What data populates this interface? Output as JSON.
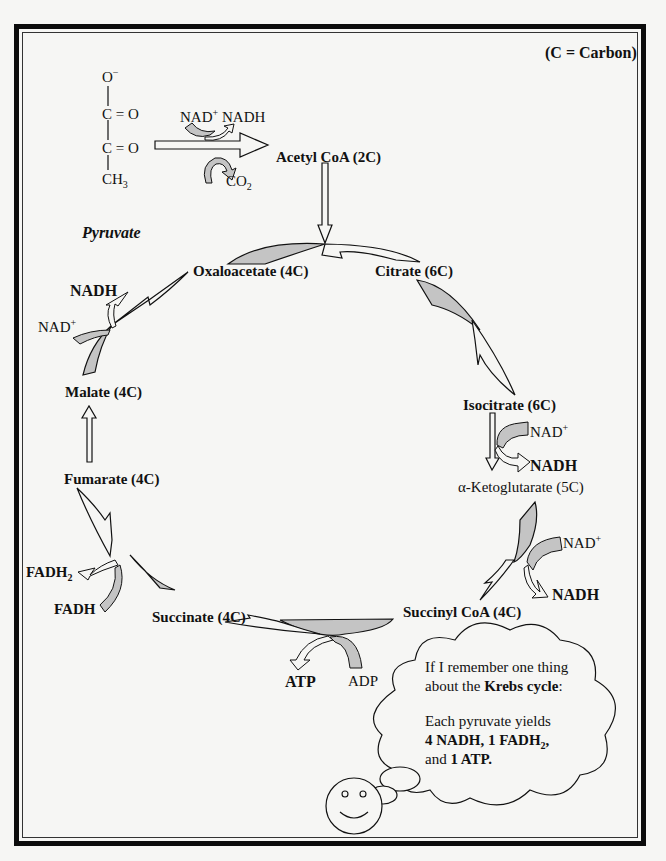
{
  "legend": {
    "carbon_note": "(C = Carbon)"
  },
  "pyruvate": {
    "name": "Pyruvate",
    "structure": [
      "O⁻",
      "C = O",
      "C = O",
      "CH₃"
    ],
    "atoms": {
      "o_minus": "O",
      "o_minus_sup": "−",
      "c1": "C = O",
      "c2": "C = O",
      "ch3": "CH",
      "ch3_sub": "3"
    }
  },
  "pyruvate_to_acetyl": {
    "nad_plus": "NAD",
    "nad_plus_sup": "+",
    "nadh": "NADH",
    "co2": "CO",
    "co2_sub": "2",
    "product": "Acetyl CoA (2C)"
  },
  "cycle": {
    "oxaloacetate": "Oxaloacetate (4C)",
    "citrate": "Citrate (6C)",
    "isocitrate": "Isocitrate (6C)",
    "alpha_ketoglutarate": "α-Ketoglutarate (5C)",
    "succinyl_coa": "Succinyl CoA (4C)",
    "succinate": "Succinate (4C)",
    "fumarate": "Fumarate (4C)",
    "malate": "Malate (4C)"
  },
  "cofactors": {
    "isocitrate_step": {
      "in": "NAD",
      "in_sup": "+",
      "out": "NADH"
    },
    "ketoglutarate_step": {
      "in": "NAD",
      "in_sup": "+",
      "out": "NADH"
    },
    "succinyl_step": {
      "in": "ADP",
      "out": "ATP"
    },
    "succinate_step": {
      "in": "FADH",
      "out": "FADH",
      "out_sub": "2"
    },
    "malate_step": {
      "in": "NAD",
      "in_sup": "+",
      "out": "NADH"
    }
  },
  "thought_bubble": {
    "line1": "If I remember one thing",
    "line2_pre": "about the ",
    "line2_bold": "Krebs cycle",
    "line2_post": ":",
    "line3": "Each pyruvate yields",
    "line4_a": "4 NADH, 1 FADH",
    "line4_sub": "2",
    "line4_b": ",",
    "line5_pre": "and ",
    "line5_bold": "1 ATP."
  },
  "colors": {
    "arrow_fill": "#c4c4c4",
    "line": "#111111",
    "background": "#f6f6f4"
  }
}
